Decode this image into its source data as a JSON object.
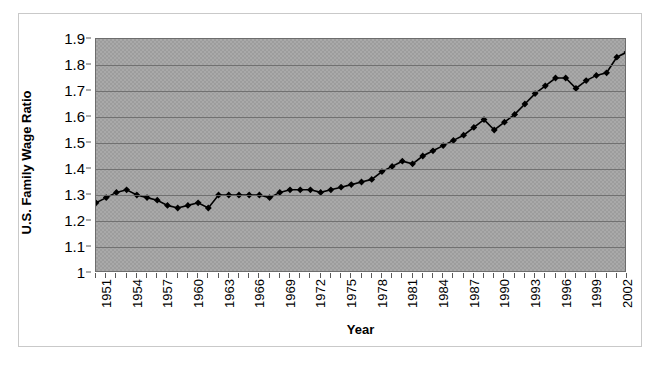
{
  "figure": {
    "background_color": "#ffffff",
    "frame_color": "#c9c9c9",
    "plot_background_color": "#a9a9a9",
    "gridline_color": "#696969",
    "series_color": "#000000"
  },
  "axis": {
    "y_title": "U.S. Family Wage Ratio",
    "x_title": "Year",
    "y_tick_labels": [
      "1.9",
      "1.8",
      "1.7",
      "1.6",
      "1.5",
      "1.4",
      "1.3",
      "1.2",
      "1.1",
      "1"
    ],
    "x_tick_labels": [
      "1951",
      "1954",
      "1957",
      "1960",
      "1963",
      "1966",
      "1969",
      "1972",
      "1975",
      "1978",
      "1981",
      "1984",
      "1987",
      "1990",
      "1993",
      "1996",
      "1999",
      "2002"
    ]
  },
  "chart_data": {
    "type": "line",
    "title": "",
    "subtitle": "",
    "xlabel": "Year",
    "ylabel": "U.S. Family Wage Ratio",
    "xlim": [
      1951,
      2003
    ],
    "ylim": [
      1.0,
      1.9
    ],
    "ytick_values": [
      1.0,
      1.1,
      1.2,
      1.3,
      1.4,
      1.5,
      1.6,
      1.7,
      1.8,
      1.9
    ],
    "xtick_values": [
      1951,
      1954,
      1957,
      1960,
      1963,
      1966,
      1969,
      1972,
      1975,
      1978,
      1981,
      1984,
      1987,
      1990,
      1993,
      1996,
      1999,
      2002
    ],
    "grid": "horizontal",
    "legend": "none",
    "marker": "diamond",
    "x": [
      1951,
      1952,
      1953,
      1954,
      1955,
      1956,
      1957,
      1958,
      1959,
      1960,
      1961,
      1962,
      1963,
      1964,
      1965,
      1966,
      1967,
      1968,
      1969,
      1970,
      1971,
      1972,
      1973,
      1974,
      1975,
      1976,
      1977,
      1978,
      1979,
      1980,
      1981,
      1982,
      1983,
      1984,
      1985,
      1986,
      1987,
      1988,
      1989,
      1990,
      1991,
      1992,
      1993,
      1994,
      1995,
      1996,
      1997,
      1998,
      1999,
      2000,
      2001,
      2002,
      2003
    ],
    "values": [
      1.27,
      1.29,
      1.31,
      1.32,
      1.3,
      1.29,
      1.28,
      1.26,
      1.25,
      1.26,
      1.27,
      1.25,
      1.3,
      1.3,
      1.3,
      1.3,
      1.3,
      1.29,
      1.31,
      1.32,
      1.32,
      1.32,
      1.31,
      1.32,
      1.33,
      1.34,
      1.35,
      1.36,
      1.39,
      1.41,
      1.43,
      1.42,
      1.45,
      1.47,
      1.49,
      1.51,
      1.53,
      1.56,
      1.59,
      1.55,
      1.58,
      1.61,
      1.65,
      1.69,
      1.72,
      1.75,
      1.75,
      1.71,
      1.74,
      1.76,
      1.77,
      1.83,
      1.85
    ],
    "series": [
      {
        "name": "U.S. Family Wage Ratio",
        "color": "#000000",
        "values": [
          1.27,
          1.29,
          1.31,
          1.32,
          1.3,
          1.29,
          1.28,
          1.26,
          1.25,
          1.26,
          1.27,
          1.25,
          1.3,
          1.3,
          1.3,
          1.3,
          1.3,
          1.29,
          1.31,
          1.32,
          1.32,
          1.32,
          1.31,
          1.32,
          1.33,
          1.34,
          1.35,
          1.36,
          1.39,
          1.41,
          1.43,
          1.42,
          1.45,
          1.47,
          1.49,
          1.51,
          1.53,
          1.56,
          1.59,
          1.55,
          1.58,
          1.61,
          1.65,
          1.69,
          1.72,
          1.75,
          1.75,
          1.71,
          1.74,
          1.76,
          1.77,
          1.83,
          1.85
        ]
      }
    ]
  }
}
